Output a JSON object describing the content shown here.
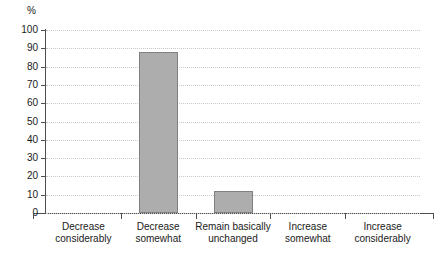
{
  "chart_data": {
    "type": "bar",
    "title": "",
    "xlabel": "",
    "ylabel": "%",
    "unit_label": "%",
    "categories": [
      "Decrease considerably",
      "Decrease somewhat",
      "Remain basically unchanged",
      "Increase somewhat",
      "Increase considerably"
    ],
    "category_lines": [
      [
        "Decrease",
        "considerably"
      ],
      [
        "Decrease",
        "somewhat"
      ],
      [
        "Remain basically",
        "unchanged"
      ],
      [
        "Increase",
        "somewhat"
      ],
      [
        "Increase",
        "considerably"
      ]
    ],
    "values": [
      0,
      88,
      12,
      0,
      0
    ],
    "ylim": [
      0,
      100
    ],
    "yticks": [
      0,
      10,
      20,
      30,
      40,
      50,
      60,
      70,
      80,
      90,
      100
    ],
    "ytick_labels": [
      "0",
      "10",
      "20",
      "30",
      "40",
      "50",
      "60",
      "70",
      "80",
      "90",
      "100"
    ],
    "grid": true,
    "grid_style": "dotted",
    "legend": "none",
    "colors": {
      "bar_fill": "#adadad",
      "bar_border": "#808080",
      "gridline": "#c9c9c9",
      "axis": "#4d4d4d",
      "text": "#1a1a1a",
      "background": "#ffffff"
    }
  }
}
